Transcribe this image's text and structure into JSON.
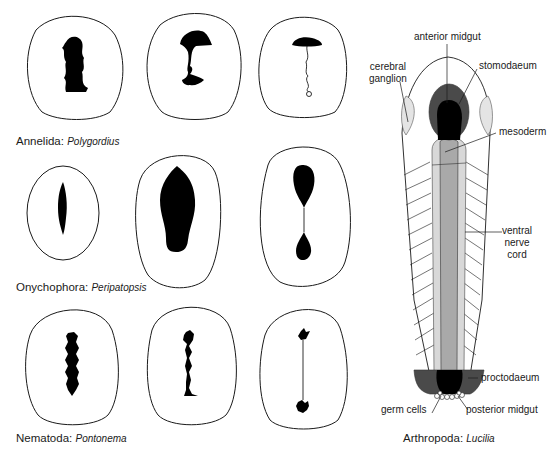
{
  "figure": {
    "panels": [
      {
        "phylum": "Annelida",
        "genus": "Polygordius",
        "caption_phylum": "Annelida:",
        "caption_genus": "Polygordius",
        "stages": [
          "blastopore elongate",
          "blastopore closing medially",
          "anterior mouth, posterior anus, closure line"
        ]
      },
      {
        "phylum": "Onychophora",
        "genus": "Peripatopsis",
        "caption_phylum": "Onychophora:",
        "caption_genus": "Peripatopsis",
        "stages": [
          "slit blastopore",
          "enlarged blastopore",
          "mouth and anus separated"
        ]
      },
      {
        "phylum": "Nematoda",
        "genus": "Pontonema",
        "caption_phylum": "Nematoda:",
        "caption_genus": "Pontonema",
        "stages": [
          "elongate blastopore",
          "closing blastopore",
          "mouth and anus connected by line"
        ]
      },
      {
        "phylum": "Arthropoda",
        "genus": "Lucilia",
        "caption_phylum": "Arthropoda:",
        "caption_genus": "Lucilia",
        "labels": {
          "anterior_midgut": "anterior midgut",
          "cerebral_ganglion_1": "cerebral",
          "cerebral_ganglion_2": "ganglion",
          "stomodaeum": "stomodaeum",
          "mesoderm": "mesoderm",
          "ventral_nerve_cord_1": "ventral",
          "ventral_nerve_cord_2": "nerve",
          "ventral_nerve_cord_3": "cord",
          "proctodaeum": "proctodaeum",
          "germ_cells": "germ cells",
          "posterior_midgut": "posterior midgut"
        }
      }
    ],
    "colors": {
      "outline": "#1a1a1a",
      "blastopore": "#000000",
      "stomodaeum": "#4a4a4a",
      "mesoderm": "#a9a9a9",
      "nerve_cord": "#d8d8d8",
      "cerebral_ganglion": "#e4e4e4"
    }
  }
}
